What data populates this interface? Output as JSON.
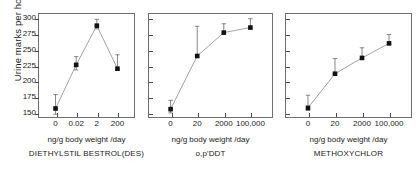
{
  "chart_data": {
    "type": "line",
    "title": "",
    "ylabel": "Urine marks per hour",
    "xlabel": "ng/g body weight /day",
    "ylim": [
      142,
      308
    ],
    "yticks": [
      150,
      175,
      200,
      225,
      250,
      275,
      300
    ],
    "grid": false,
    "legend": "none",
    "marker": "filled-square",
    "errorbars": true,
    "panels": [
      {
        "caption": "DIETHYLSTIL BESTROL(DES)",
        "xlabel": "ng/g body weight /day",
        "categories": [
          "0",
          "0.02",
          "2",
          "200"
        ],
        "values": [
          157,
          226,
          288,
          220
        ],
        "err_low": [
          9,
          8,
          5,
          2
        ],
        "err_high": [
          22,
          13,
          10,
          22
        ]
      },
      {
        "caption": "o,p'DDT",
        "xlabel": "ng/g body weight /day",
        "categories": [
          "0",
          "20",
          "2000",
          "100,000"
        ],
        "values": [
          156,
          240,
          277,
          285
        ],
        "err_low": [
          6,
          2,
          2,
          2
        ],
        "err_high": [
          14,
          47,
          14,
          14
        ]
      },
      {
        "caption": "METHOXYCHLOR",
        "xlabel": "ng/g body weight /day",
        "categories": [
          "0",
          "20",
          "2000",
          "100,000"
        ],
        "values": [
          158,
          212,
          237,
          260
        ],
        "err_low": [
          4,
          2,
          2,
          2
        ],
        "err_high": [
          20,
          24,
          16,
          14
        ]
      }
    ]
  },
  "figure": {
    "ylabel": "Urine marks per hour",
    "ytick_labels": [
      "300",
      "275",
      "250",
      "225",
      "200",
      "175",
      "150"
    ]
  }
}
